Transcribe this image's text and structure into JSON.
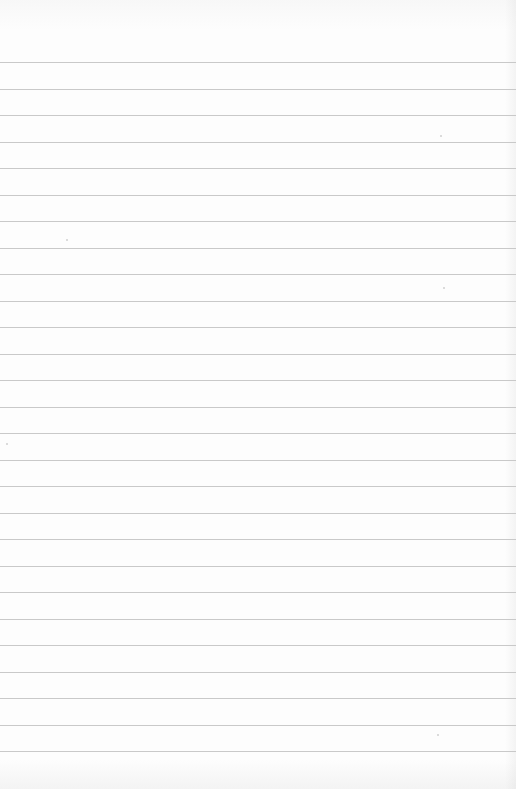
{
  "sheet": {
    "type": "ruled-paper",
    "background_color": "#fdfdfd",
    "line_color": "#c9c9c9",
    "first_line_y": 62,
    "line_spacing": 26.5,
    "line_count": 27
  },
  "specks": [
    {
      "x": 66,
      "y": 239
    },
    {
      "x": 443,
      "y": 287
    },
    {
      "x": 6,
      "y": 443
    },
    {
      "x": 440,
      "y": 135
    },
    {
      "x": 437,
      "y": 734
    }
  ]
}
